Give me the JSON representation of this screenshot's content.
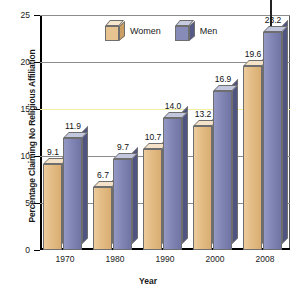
{
  "chart_data": {
    "type": "bar",
    "title": "",
    "xlabel": "Year",
    "ylabel": "Percentage Claiming No Religious Affiliation",
    "categories": [
      "1970",
      "1980",
      "1990",
      "2000",
      "2008"
    ],
    "series": [
      {
        "name": "Women",
        "color": "#E3BC85",
        "values": [
          9.1,
          6.7,
          10.7,
          13.2,
          19.6
        ]
      },
      {
        "name": "Men",
        "color": "#8186B5",
        "values": [
          11.9,
          9.7,
          14.0,
          16.9,
          23.2
        ]
      }
    ],
    "ylim": [
      0,
      25
    ],
    "yticks": [
      "0",
      "5",
      "10",
      "15",
      "20",
      "25"
    ],
    "grid": true,
    "gridline_highlight": {
      "value": "15",
      "color": "#F2EFA0"
    },
    "legend_position": "top-center",
    "annotations": [
      {
        "type": "arrow-down",
        "target_series": "Men",
        "target_category": "2008",
        "target_value": 23.2
      }
    ],
    "data_labels": [
      "9.1",
      "11.9",
      "6.7",
      "9.7",
      "10.7",
      "14.0",
      "13.2",
      "16.9",
      "19.6",
      "23.2"
    ]
  },
  "axis": {
    "y_title": "Percentage Claiming No Religious Affiliation",
    "x_title": "Year",
    "y_ticks": [
      "25",
      "20",
      "15",
      "10",
      "5",
      "0"
    ]
  },
  "legend": {
    "women_label": "Women",
    "men_label": "Men"
  }
}
